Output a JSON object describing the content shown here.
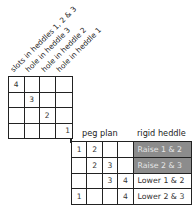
{
  "threading_labels": [
    "slots in heddles 1, 2 & 3",
    "hole in heddle 3",
    "hole in heddle 2",
    "hole in heddle 1"
  ],
  "tieup_grid": [
    [
      "4",
      "",
      "",
      ""
    ],
    [
      "",
      "3",
      "",
      ""
    ],
    [
      "",
      "",
      "2",
      ""
    ],
    [
      "",
      "",
      "",
      "1"
    ]
  ],
  "headers": {
    "peg_plan": "peg plan",
    "rigid_heddle": "rigid heddle"
  },
  "peg_plan_rows": [
    {
      "cells": [
        "1",
        "2",
        "",
        ""
      ],
      "action": "Raise 1 & 2",
      "shaded": true
    },
    {
      "cells": [
        "",
        "2",
        "3",
        ""
      ],
      "action": "Raise 2 & 3",
      "shaded": true
    },
    {
      "cells": [
        "",
        "",
        "3",
        "4"
      ],
      "action": "Lower 1 & 2",
      "shaded": false
    },
    {
      "cells": [
        "1",
        "",
        "",
        "4"
      ],
      "action": "Lower 2 & 3",
      "shaded": false
    }
  ],
  "colors": {
    "shade": "#8c8c8c",
    "line": "#222222"
  }
}
